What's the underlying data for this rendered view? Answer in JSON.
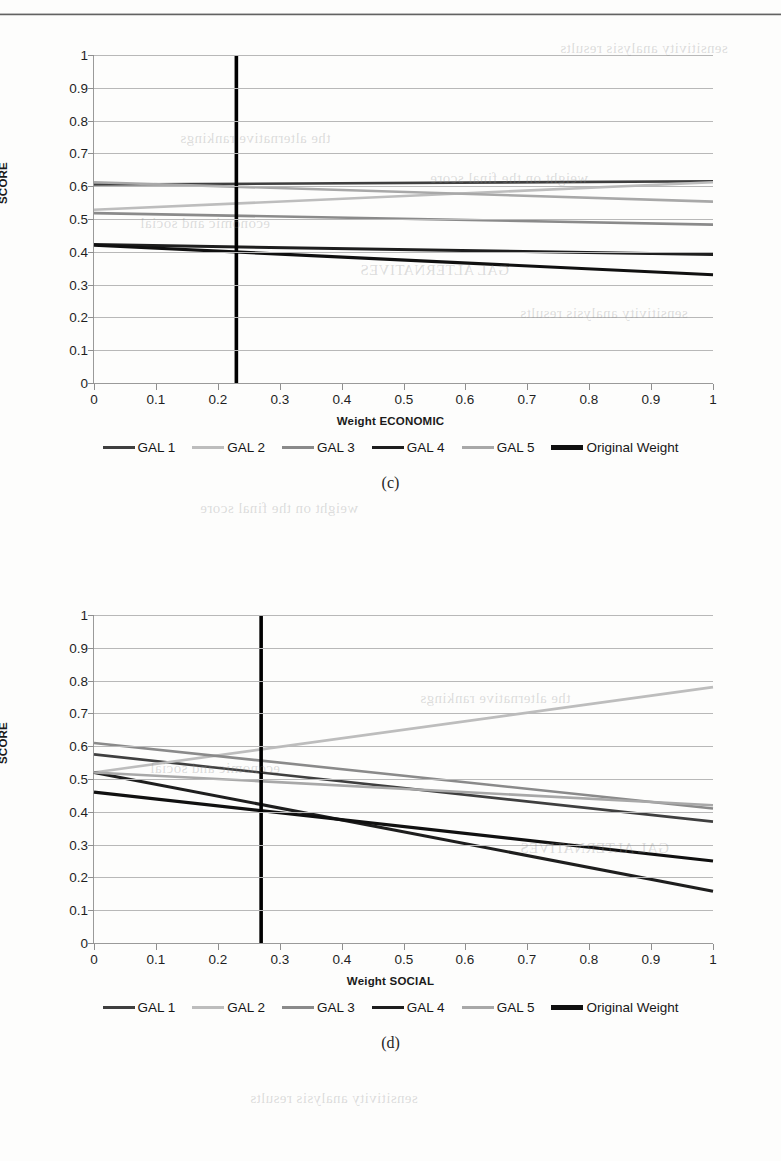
{
  "page": {
    "figures": [
      "c",
      "d"
    ],
    "caption_c": "(c)",
    "caption_d": "(d)",
    "bleed_text": [
      "sensitivity analysis results",
      "the alternative rankings",
      "weight on the final score",
      "economic and social",
      "GAL ALTERNATIVES"
    ]
  },
  "series_style": {
    "GAL 1": "#3f3f3f",
    "GAL 2": "#bdbdbd",
    "GAL 3": "#8a8a8a",
    "GAL 4": "#1e1e1e",
    "GAL 5": "#a8a8a8",
    "Original Weight": "#101010"
  },
  "legend": {
    "items": [
      {
        "label": "GAL 1",
        "color": "#3f3f3f",
        "width": 3.0
      },
      {
        "label": "GAL 2",
        "color": "#bdbdbd",
        "width": 3.0
      },
      {
        "label": "GAL 3",
        "color": "#8a8a8a",
        "width": 3.0
      },
      {
        "label": "GAL 4",
        "color": "#1e1e1e",
        "width": 3.4
      },
      {
        "label": "GAL 5",
        "color": "#a8a8a8",
        "width": 2.8
      },
      {
        "label": "Original Weight",
        "color": "#101010",
        "width": 4.2
      }
    ]
  },
  "chart_data": [
    {
      "id": "c",
      "type": "line",
      "title": "",
      "xlabel": "Weight ECONOMIC",
      "ylabel": "SCORE",
      "xlim": [
        0,
        1
      ],
      "ylim": [
        0,
        1
      ],
      "xticks": [
        0,
        0.1,
        0.2,
        0.3,
        0.4,
        0.5,
        0.6,
        0.7,
        0.8,
        0.9,
        1
      ],
      "xtick_labels": [
        "0",
        "0.1",
        "0.2",
        "0.3",
        "0.4",
        "0.5",
        "0.6",
        "0.7",
        "0.8",
        "0.9",
        "1"
      ],
      "yticks": [
        0,
        0.1,
        0.2,
        0.3,
        0.4,
        0.5,
        0.6,
        0.7,
        0.8,
        0.9,
        1
      ],
      "ytick_labels": [
        "0",
        "0.1",
        "0.2",
        "0.3",
        "0.4",
        "0.5",
        "0.6",
        "0.7",
        "0.8",
        "0.9",
        "1"
      ],
      "grid": true,
      "legend_position": "bottom",
      "x": [
        0,
        1
      ],
      "series": [
        {
          "name": "GAL 1",
          "values": [
            0.605,
            0.615
          ],
          "color": "#3f3f3f"
        },
        {
          "name": "GAL 2",
          "values": [
            0.528,
            0.612
          ],
          "color": "#bdbdbd"
        },
        {
          "name": "GAL 3",
          "values": [
            0.518,
            0.483
          ],
          "color": "#8a8a8a"
        },
        {
          "name": "GAL 4",
          "values": [
            0.422,
            0.392
          ],
          "color": "#1e1e1e"
        },
        {
          "name": "GAL 5",
          "values": [
            0.612,
            0.553
          ],
          "color": "#a8a8a8"
        },
        {
          "name": "Original Weight",
          "values": [
            0.42,
            0.33
          ],
          "color": "#101010"
        }
      ],
      "reference_line": {
        "label": "Original Weight",
        "x": 0.23,
        "color": "#000000",
        "width": 3.6
      }
    },
    {
      "id": "d",
      "type": "line",
      "title": "",
      "xlabel": "Weight SOCIAL",
      "ylabel": "SCORE",
      "xlim": [
        0,
        1
      ],
      "ylim": [
        0,
        1
      ],
      "xticks": [
        0,
        0.1,
        0.2,
        0.3,
        0.4,
        0.5,
        0.6,
        0.7,
        0.8,
        0.9,
        1
      ],
      "xtick_labels": [
        "0",
        "0.1",
        "0.2",
        "0.3",
        "0.4",
        "0.5",
        "0.6",
        "0.7",
        "0.8",
        "0.9",
        "1"
      ],
      "yticks": [
        0,
        0.1,
        0.2,
        0.3,
        0.4,
        0.5,
        0.6,
        0.7,
        0.8,
        0.9,
        1
      ],
      "ytick_labels": [
        "0",
        "0.1",
        "0.2",
        "0.3",
        "0.4",
        "0.5",
        "0.6",
        "0.7",
        "0.8",
        "0.9",
        "1"
      ],
      "grid": true,
      "legend_position": "bottom",
      "x": [
        0,
        1
      ],
      "series": [
        {
          "name": "GAL 1",
          "values": [
            0.575,
            0.37
          ],
          "color": "#3f3f3f"
        },
        {
          "name": "GAL 2",
          "values": [
            0.52,
            0.78
          ],
          "color": "#bdbdbd"
        },
        {
          "name": "GAL 3",
          "values": [
            0.61,
            0.41
          ],
          "color": "#8a8a8a"
        },
        {
          "name": "GAL 4",
          "values": [
            0.52,
            0.158
          ],
          "color": "#1e1e1e"
        },
        {
          "name": "GAL 5",
          "values": [
            0.52,
            0.42
          ],
          "color": "#a8a8a8"
        },
        {
          "name": "Original Weight",
          "values": [
            0.46,
            0.25
          ],
          "color": "#101010"
        }
      ],
      "reference_line": {
        "label": "Original Weight",
        "x": 0.27,
        "color": "#000000",
        "width": 3.6
      }
    }
  ]
}
